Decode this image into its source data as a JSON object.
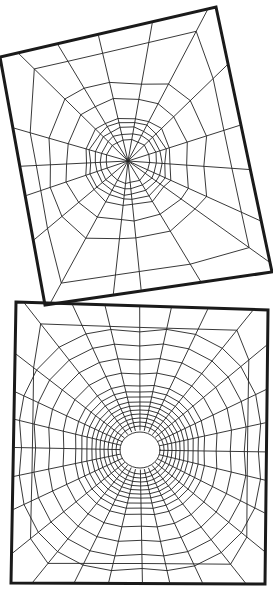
{
  "figure": {
    "colors": {
      "background": "#ffffff",
      "ink": "#222222",
      "frame": "#1a1a1a"
    }
  },
  "webs": [
    {
      "name": "top-web",
      "frame": [
        [
          0,
          57
        ],
        [
          216,
          7
        ],
        [
          272,
          272
        ],
        [
          45,
          305
        ]
      ],
      "hub": [
        128,
        161
      ],
      "spokes": 18,
      "rings": [
        22,
        28,
        33,
        38,
        43,
        60,
        78
      ],
      "inner_rings_visible": false,
      "irregular": true
    },
    {
      "name": "bottom-web",
      "frame": [
        [
          16,
          302
        ],
        [
          268,
          310
        ],
        [
          265,
          584
        ],
        [
          11,
          583
        ]
      ],
      "hub": [
        140,
        450
      ],
      "hub_hole_rx": 20,
      "hub_hole_ry": 18,
      "spokes": 28,
      "rings": [
        24,
        28,
        32,
        36,
        40,
        44,
        48,
        53,
        58,
        64,
        76,
        90,
        104,
        118
      ],
      "irregular": false
    }
  ]
}
